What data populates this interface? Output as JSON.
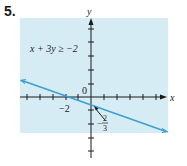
{
  "problem": {
    "number": "5."
  },
  "graph": {
    "inequality": "x + 3y ≥ −2",
    "x_axis_label": "x",
    "y_axis_label": "y",
    "origin_label": "0",
    "x_intercept_label": "−2",
    "y_intercept_numerator": "2",
    "y_intercept_sign": "−",
    "y_intercept_denominator": "3",
    "shade_color": "#d6ecf5",
    "line_color": "#3b9fd1",
    "axis_color": "#1a1a1a"
  }
}
